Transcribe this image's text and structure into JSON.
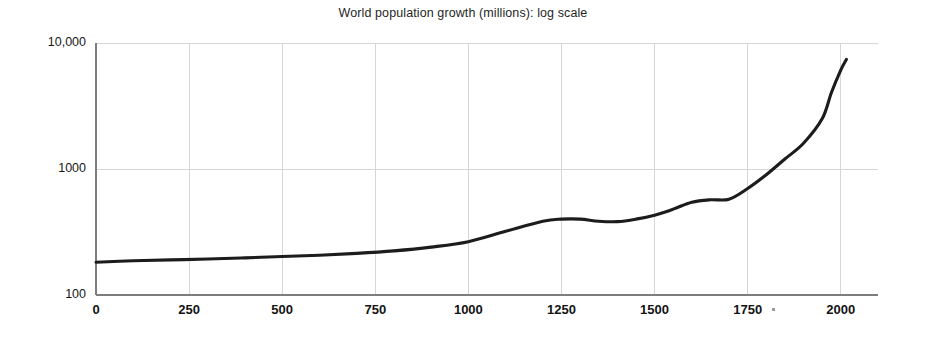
{
  "chart_data": {
    "type": "line",
    "title": "World population growth (millions): log scale",
    "xlabel": "",
    "ylabel": "",
    "yscale": "log",
    "xscale": "linear",
    "grid": true,
    "legend": false,
    "xlim": [
      0,
      2100
    ],
    "ylim": [
      100,
      10000
    ],
    "xticks": [
      0,
      250,
      500,
      750,
      1000,
      1250,
      1500,
      1750,
      2000
    ],
    "xtick_labels": [
      "0",
      "250",
      "500",
      "750",
      "1000",
      "1250",
      "1500",
      "1750",
      "2000"
    ],
    "yticks": [
      100,
      1000,
      10000
    ],
    "ytick_labels": [
      "100",
      "1000",
      "10,000"
    ],
    "series": [
      {
        "name": "World population (millions)",
        "x": [
          0,
          100,
          200,
          300,
          400,
          500,
          600,
          700,
          800,
          900,
          1000,
          1100,
          1200,
          1250,
          1300,
          1350,
          1400,
          1450,
          1500,
          1550,
          1600,
          1650,
          1700,
          1750,
          1800,
          1850,
          1900,
          1950,
          1975,
          2000,
          2015
        ],
        "y": [
          182,
          187,
          190,
          193,
          197,
          202,
          207,
          214,
          224,
          240,
          265,
          320,
          385,
          400,
          400,
          385,
          382,
          400,
          430,
          480,
          545,
          570,
          575,
          700,
          900,
          1200,
          1600,
          2500,
          4050,
          6100,
          7400
        ]
      }
    ]
  }
}
